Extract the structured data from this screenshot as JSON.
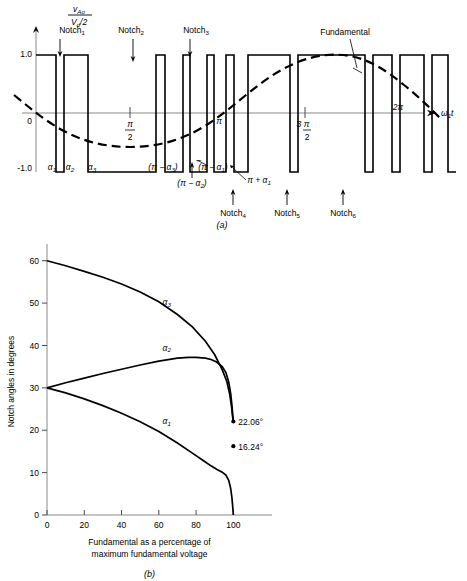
{
  "figure": {
    "panel_a": {
      "caption": "(a)",
      "y_axis_label_num": "v",
      "y_axis_label_num_sub": "Ao",
      "y_axis_label_den": "V",
      "y_axis_label_den_sub": "d",
      "y_axis_label_den_tail": "/2",
      "x_axis_label": "ω",
      "x_axis_label_sub": "1",
      "x_axis_label_tail": "t",
      "y_ticks": [
        "1.0",
        "-1.0"
      ],
      "origin_label": "0",
      "x_ticks": [
        {
          "label_top": "π",
          "label_bottom": "2",
          "x": 130
        },
        {
          "label_top": "π",
          "label_bottom": "",
          "x": 216
        },
        {
          "label_top": "3 π",
          "label_bottom": "2",
          "x": 305
        },
        {
          "label_top": "2π",
          "label_bottom": "",
          "x": 392
        }
      ],
      "notch_labels_top": [
        {
          "text": "Notch",
          "sub": "1",
          "x": 72,
          "y": 36,
          "arrow_x": 62,
          "arrow_y0": 42,
          "arrow_y1": 56
        },
        {
          "text": "Notch",
          "sub": "2",
          "x": 130,
          "y": 36,
          "arrow_x": 134,
          "arrow_y0": 42,
          "arrow_y1": 60
        },
        {
          "text": "Notch",
          "sub": "3",
          "x": 196,
          "y": 36,
          "arrow_x": 192,
          "arrow_y0": 42,
          "arrow_y1": 56
        }
      ],
      "notch_labels_bottom": [
        {
          "text": "Notch",
          "sub": "4",
          "x": 229,
          "y": 212,
          "arrow_x": 233,
          "arrow_y0": 205,
          "arrow_y1": 192
        },
        {
          "text": "Notch",
          "sub": "5",
          "x": 282,
          "y": 212,
          "arrow_x": 286,
          "arrow_y0": 205,
          "arrow_y1": 192
        },
        {
          "text": "Notch",
          "sub": "6",
          "x": 338,
          "y": 212,
          "arrow_x": 342,
          "arrow_y0": 205,
          "arrow_y1": 192
        }
      ],
      "fundamental_label": "Fundamental",
      "angle_labels": [
        {
          "text": "α",
          "sub": "1",
          "x": 52,
          "y": 168
        },
        {
          "text": "α",
          "sub": "2",
          "x": 69,
          "y": 168
        },
        {
          "text": "α",
          "sub": "3",
          "x": 90,
          "y": 168
        },
        {
          "text": "(π − α",
          "sub": "3",
          "tail": ")",
          "x": 160,
          "y": 168
        },
        {
          "text": "(π − α",
          "sub": "1",
          "tail": ")",
          "x": 206,
          "y": 168
        },
        {
          "text": "(π − α",
          "sub": "2",
          "tail": ")",
          "x": 188,
          "y": 183
        },
        {
          "text": "π + α",
          "sub": "1",
          "tail": "",
          "x": 246,
          "y": 180
        }
      ],
      "waveform_levels": [
        1.0,
        -1.0
      ],
      "pulse_edges": [
        36,
        56,
        64,
        88,
        96,
        156,
        165,
        183,
        190,
        207,
        214,
        226,
        234,
        248,
        256,
        290,
        298,
        365,
        373,
        392,
        400,
        424,
        432,
        448
      ],
      "fundamental_amplitude": 0.82
    },
    "panel_b": {
      "caption": "(b)",
      "chart_data": {
        "type": "line",
        "title": "",
        "xlabel": "Fundamental as a percentage of maximum fundamental voltage",
        "ylabel": "Notch angles in degrees",
        "xlim": [
          0,
          110
        ],
        "ylim": [
          0,
          63
        ],
        "xticks": [
          0,
          20,
          40,
          60,
          80,
          100
        ],
        "yticks": [
          0,
          10,
          20,
          30,
          40,
          50,
          60
        ],
        "grid": false,
        "legend": "inline-curve-labels",
        "series": [
          {
            "name": "α3",
            "label": "α",
            "label_sub": "3",
            "label_x": 62,
            "label_y": 49.5,
            "x": [
              0,
              10,
              20,
              30,
              40,
              50,
              60,
              70,
              78,
              85,
              90,
              94,
              96.5,
              98,
              99,
              99.5,
              99.8,
              100
            ],
            "y": [
              60,
              58.8,
              57.5,
              56.1,
              54.5,
              52.6,
              50.3,
              47.3,
              44.4,
              41.0,
              37.8,
              34.3,
              31.5,
              28.6,
              25.6,
              23.6,
              22.5,
              22.06
            ]
          },
          {
            "name": "α2",
            "label": "α",
            "label_sub": "2",
            "label_x": 62,
            "label_y": 38.8,
            "x": [
              0,
              10,
              20,
              30,
              40,
              50,
              60,
              70,
              76,
              80,
              85,
              88,
              91,
              94,
              96,
              97.5,
              98.6,
              99.3,
              99.7,
              100
            ],
            "y": [
              30,
              31.2,
              32.3,
              33.4,
              34.4,
              35.4,
              36.3,
              37.0,
              37.2,
              37.2,
              37.0,
              36.7,
              36.1,
              35.0,
              33.6,
              31.4,
              28.5,
              25.6,
              23.4,
              22.06
            ]
          },
          {
            "name": "α1",
            "label": "α",
            "label_sub": "1",
            "label_x": 62,
            "label_y": 21.5,
            "x": [
              0,
              10,
              20,
              30,
              40,
              50,
              60,
              70,
              78,
              84,
              88,
              91,
              94,
              96,
              97.5,
              98.5,
              99.2,
              99.6,
              100
            ],
            "y": [
              30,
              28.8,
              27.4,
              25.8,
              24.0,
              22.0,
              19.7,
              17.0,
              14.6,
              12.8,
              11.6,
              10.8,
              10.1,
              9.4,
              8.2,
              6.4,
              4.2,
              2.2,
              0
            ]
          }
        ],
        "annotations": [
          {
            "text": "22.06°",
            "x": 100,
            "y": 22.06
          },
          {
            "text": "16.24°",
            "x": 100,
            "y": 16.24
          }
        ]
      }
    }
  }
}
